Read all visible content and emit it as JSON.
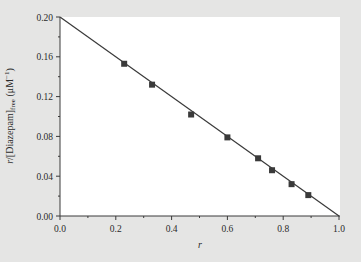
{
  "chart_data": {
    "type": "scatter",
    "title": "",
    "xlabel": "r",
    "ylabel": "r/[Diazepam]free (μM⁻¹)",
    "ylabel_parts": {
      "main": "r/[Diazepam]",
      "sub": "free",
      "unit": " (μM",
      "sup": "−1",
      "close": ")"
    },
    "xlim": [
      0.0,
      1.0
    ],
    "ylim": [
      0.0,
      0.2
    ],
    "xticks": [
      "0.0",
      "0.2",
      "0.4",
      "0.6",
      "0.8",
      "1.0"
    ],
    "yticks": [
      "0.00",
      "0.04",
      "0.08",
      "0.12",
      "0.16",
      "0.20"
    ],
    "grid": false,
    "legend": null,
    "series": [
      {
        "name": "Data",
        "marker": "square",
        "x": [
          0.23,
          0.33,
          0.47,
          0.6,
          0.71,
          0.76,
          0.83,
          0.89
        ],
        "y": [
          0.153,
          0.132,
          0.102,
          0.079,
          0.058,
          0.046,
          0.032,
          0.021
        ]
      },
      {
        "name": "Linear fit",
        "type": "line",
        "x": [
          0.0,
          1.0
        ],
        "y": [
          0.2,
          0.0
        ]
      }
    ]
  },
  "colors": {
    "background": "#e5e5e4",
    "plot_area": "#ffffff",
    "line": "#3a3a3a",
    "marker": "#3a3a3a"
  }
}
